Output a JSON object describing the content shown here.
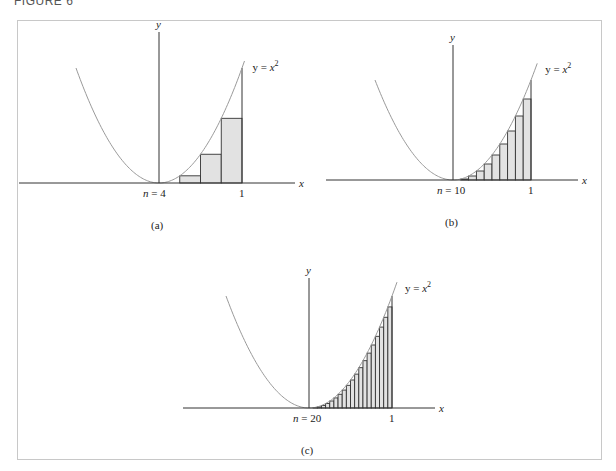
{
  "header": {
    "label": "FIGURE 6"
  },
  "panels": [
    {
      "id": "a",
      "caption": "(a)",
      "n": 4,
      "n_label": "n = 4",
      "one_label": "1",
      "x_axis_label": "x",
      "y_axis_label": "y",
      "curve_label": "y = x",
      "curve_exponent": "2",
      "geometry": {
        "ox": 159,
        "oy": 183,
        "ux": 83,
        "uy": 115,
        "xmin": 19,
        "xmax": 295,
        "ytop": 32,
        "curve_xmin": -1.0,
        "curve_xmax": 1.03
      }
    },
    {
      "id": "b",
      "caption": "(b)",
      "n": 10,
      "n_label": "n = 10",
      "one_label": "1",
      "x_axis_label": "x",
      "y_axis_label": "y",
      "curve_label": "y = x",
      "curve_exponent": "2",
      "geometry": {
        "ox": 453,
        "oy": 180,
        "ux": 78,
        "uy": 100,
        "xmin": 326,
        "xmax": 578,
        "ytop": 45,
        "curve_xmin": -1.0,
        "curve_xmax": 1.08
      }
    },
    {
      "id": "c",
      "caption": "(c)",
      "n": 20,
      "n_label": "n = 20",
      "one_label": "1",
      "x_axis_label": "x",
      "y_axis_label": "y",
      "curve_label": "y = x",
      "curve_exponent": "2",
      "geometry": {
        "ox": 309,
        "oy": 408,
        "ux": 83,
        "uy": 112,
        "xmin": 183,
        "xmax": 435,
        "ytop": 278,
        "curve_xmin": -1.0,
        "curve_xmax": 1.06
      }
    }
  ],
  "chart_data": {
    "type": "area",
    "function": "y = x^2",
    "interval": [
      0,
      1
    ],
    "rule": "left endpoints (lower sum)",
    "panels": [
      {
        "label": "(a)",
        "n": 4,
        "rect_heights": [
          0,
          0.0625,
          0.25,
          0.5625
        ]
      },
      {
        "label": "(b)",
        "n": 10,
        "rect_heights": [
          0,
          0.01,
          0.04,
          0.09,
          0.16,
          0.25,
          0.36,
          0.49,
          0.64,
          0.81
        ]
      },
      {
        "label": "(c)",
        "n": 20,
        "rect_heights": [
          0,
          0.0025,
          0.01,
          0.0225,
          0.04,
          0.0625,
          0.09,
          0.1225,
          0.16,
          0.2025,
          0.25,
          0.3025,
          0.36,
          0.4225,
          0.49,
          0.5625,
          0.64,
          0.7225,
          0.81,
          0.9025
        ]
      }
    ],
    "xlabel": "x",
    "ylabel": "y",
    "tick_labels": [
      "1"
    ],
    "grid": false
  },
  "colors": {
    "curve": "#9a9a9a",
    "axis": "#333333",
    "rect_fill": "#e2e2e2",
    "rect_stroke": "#333333",
    "frame": "#c8c8c8"
  }
}
